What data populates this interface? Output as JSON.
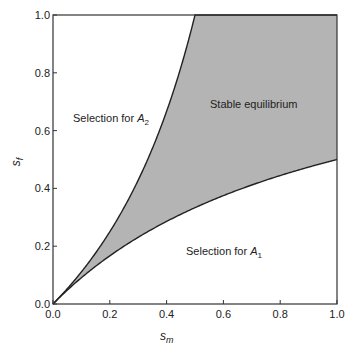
{
  "chart_data": {
    "type": "area",
    "title": "",
    "xlabel": "s_m",
    "ylabel": "s_f",
    "xlim": [
      0.0,
      1.0
    ],
    "ylim": [
      0.0,
      1.0
    ],
    "grid": false,
    "x_ticks": [
      "0.0",
      "0.2",
      "0.4",
      "0.6",
      "0.8",
      "1.0"
    ],
    "y_ticks": [
      "0.0",
      "0.2",
      "0.4",
      "0.6",
      "0.8",
      "1.0"
    ],
    "series": [
      {
        "name": "upper boundary",
        "formula": "s_f = s_m / (1 - s_m)",
        "x": [
          0.0,
          0.1,
          0.2,
          0.3,
          0.4,
          0.5,
          0.6,
          0.7,
          0.8,
          0.9,
          1.0
        ],
        "y": [
          0.0,
          0.111,
          0.25,
          0.429,
          0.667,
          1.0,
          1.0,
          1.0,
          1.0,
          1.0,
          1.0
        ]
      },
      {
        "name": "lower boundary",
        "formula": "s_f = s_m / (1 + s_m)",
        "x": [
          0.0,
          0.1,
          0.2,
          0.3,
          0.4,
          0.5,
          0.6,
          0.7,
          0.8,
          0.9,
          1.0
        ],
        "y": [
          0.0,
          0.091,
          0.167,
          0.231,
          0.286,
          0.333,
          0.375,
          0.412,
          0.444,
          0.474,
          0.5
        ]
      }
    ],
    "shaded_region": {
      "between": [
        "lower boundary",
        "upper boundary"
      ],
      "color": "#b4b4b4",
      "label": "Stable equilibrium"
    },
    "annotations": [
      {
        "text": "Selection for A",
        "subscript": "2",
        "x": 0.07,
        "y": 0.62
      },
      {
        "text": "Stable equilibrium",
        "x": 0.6,
        "y": 0.66
      },
      {
        "text": "Selection for A",
        "subscript": "1",
        "x": 0.47,
        "y": 0.17
      }
    ]
  },
  "labels": {
    "xlabel_main": "s",
    "xlabel_sub": "m",
    "ylabel_main": "s",
    "ylabel_sub": "f",
    "region_a2": "Selection for ",
    "region_a2_var": "A",
    "region_a2_sub": "2",
    "region_stable": "Stable equilibrium",
    "region_a1": "Selection for ",
    "region_a1_var": "A",
    "region_a1_sub": "1",
    "xt0": "0.0",
    "xt1": "0.2",
    "xt2": "0.4",
    "xt3": "0.6",
    "xt4": "0.8",
    "xt5": "1.0",
    "yt0": "0.0",
    "yt1": "0.2",
    "yt2": "0.4",
    "yt3": "0.6",
    "yt4": "0.8",
    "yt5": "1.0"
  },
  "colors": {
    "fill": "#b4b4b4",
    "line": "#222222",
    "axis": "#333333"
  }
}
